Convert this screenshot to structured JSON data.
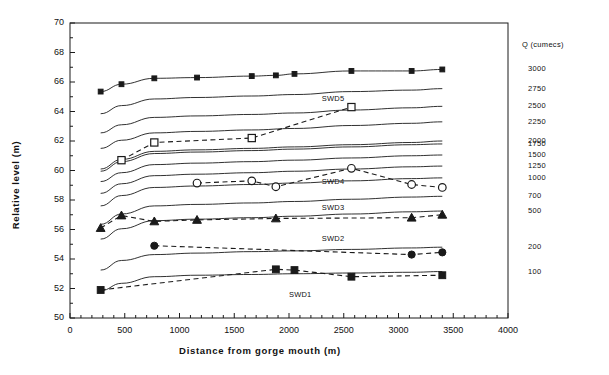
{
  "chart_data": {
    "type": "line",
    "title": "",
    "xlabel": "Distance from gorge mouth  (m)",
    "ylabel": "Relative  level   (m)",
    "xlim": [
      0,
      4000
    ],
    "ylim": [
      50,
      70
    ],
    "xticks": [
      0,
      500,
      1000,
      1500,
      2000,
      2500,
      3000,
      3500,
      4000
    ],
    "yticks": [
      50,
      52,
      54,
      56,
      58,
      60,
      62,
      64,
      66,
      68,
      70
    ],
    "xtick_minor_step": 100,
    "ytick_minor_step": 1,
    "grid": false,
    "legend_position": "right-axis-labels",
    "secondary_axis_title": "Q (cumecs)",
    "secondary_axis_labels": [
      "3000",
      "2750",
      "2500",
      "2250",
      "2000",
      "1750",
      "1500",
      "1250",
      "1000",
      "700",
      "500",
      "200",
      "100"
    ],
    "discharge_series": [
      {
        "name": "Q3000",
        "q": 3000,
        "marker": "filled-square-small",
        "style": "solid",
        "x": [
          280,
          470,
          770,
          1160,
          1660,
          1880,
          2050,
          2570,
          3120,
          3400
        ],
        "y": [
          65.35,
          65.85,
          66.25,
          66.3,
          66.4,
          66.45,
          66.55,
          66.75,
          66.75,
          66.85
        ]
      },
      {
        "name": "Q2750",
        "q": 2750,
        "marker": "none",
        "style": "solid",
        "x": [
          280,
          470,
          770,
          1160,
          1660,
          2050,
          2570,
          3120,
          3400
        ],
        "y": [
          63.85,
          64.4,
          64.85,
          64.95,
          65.05,
          65.15,
          65.35,
          65.45,
          65.55
        ]
      },
      {
        "name": "Q2500",
        "q": 2500,
        "marker": "none",
        "style": "solid",
        "x": [
          280,
          470,
          770,
          1160,
          1660,
          2050,
          2570,
          3120,
          3400
        ],
        "y": [
          62.55,
          63.1,
          63.6,
          63.7,
          63.8,
          63.9,
          64.1,
          64.25,
          64.35
        ]
      },
      {
        "name": "Q2250",
        "q": 2250,
        "marker": "none",
        "style": "solid",
        "x": [
          280,
          470,
          770,
          1160,
          1660,
          2050,
          2570,
          3120,
          3400
        ],
        "y": [
          61.5,
          62.05,
          62.55,
          62.65,
          62.75,
          62.85,
          63.05,
          63.2,
          63.3
        ]
      },
      {
        "name": "Q2000",
        "q": 2000,
        "marker": "none",
        "style": "solid",
        "x": [
          280,
          470,
          770,
          1160,
          1660,
          2050,
          2570,
          3120,
          3400
        ],
        "y": [
          60.1,
          60.75,
          61.3,
          61.4,
          61.5,
          61.6,
          61.75,
          61.9,
          62.0
        ]
      },
      {
        "name": "Q1750",
        "q": 1750,
        "marker": "none",
        "style": "solid",
        "x": [
          280,
          470,
          770,
          1160,
          1660,
          2050,
          2570,
          3120,
          3400
        ],
        "y": [
          59.95,
          60.6,
          61.15,
          61.25,
          61.35,
          61.45,
          61.6,
          61.75,
          61.8
        ]
      },
      {
        "name": "Q1500",
        "q": 1500,
        "marker": "none",
        "style": "solid",
        "x": [
          280,
          470,
          770,
          1160,
          1660,
          2050,
          2570,
          3120,
          3400
        ],
        "y": [
          59.25,
          59.85,
          60.4,
          60.5,
          60.6,
          60.7,
          60.85,
          61.0,
          61.05
        ]
      },
      {
        "name": "Q1250",
        "q": 1250,
        "marker": "none",
        "style": "solid",
        "x": [
          280,
          470,
          770,
          1160,
          1660,
          2050,
          2570,
          3120,
          3400
        ],
        "y": [
          58.45,
          59.1,
          59.65,
          59.75,
          59.85,
          59.95,
          60.1,
          60.25,
          60.3
        ]
      },
      {
        "name": "Q1000",
        "q": 1000,
        "marker": "none",
        "style": "solid",
        "x": [
          280,
          470,
          770,
          1160,
          1660,
          2050,
          2570,
          3120,
          3400
        ],
        "y": [
          57.6,
          58.3,
          58.85,
          58.95,
          59.05,
          59.15,
          59.3,
          59.45,
          59.5
        ]
      },
      {
        "name": "Q700",
        "q": 700,
        "marker": "none",
        "style": "solid",
        "x": [
          280,
          470,
          770,
          1160,
          1660,
          2050,
          2570,
          3120,
          3400
        ],
        "y": [
          56.35,
          57.05,
          57.6,
          57.7,
          57.8,
          57.9,
          58.05,
          58.2,
          58.25
        ]
      },
      {
        "name": "Q500",
        "q": 500,
        "marker": "none",
        "style": "solid",
        "x": [
          280,
          470,
          770,
          1160,
          1660,
          2050,
          2570,
          3120,
          3400
        ],
        "y": [
          55.35,
          56.05,
          56.6,
          56.7,
          56.8,
          56.9,
          57.05,
          57.2,
          57.25
        ]
      },
      {
        "name": "Q200",
        "q": 200,
        "marker": "none",
        "style": "solid",
        "x": [
          280,
          470,
          770,
          1160,
          1660,
          2050,
          2570,
          3120,
          3400
        ],
        "y": [
          53.25,
          53.9,
          54.3,
          54.4,
          54.5,
          54.55,
          54.65,
          54.75,
          54.8
        ]
      },
      {
        "name": "Q100",
        "q": 100,
        "marker": "none",
        "style": "solid",
        "x": [
          280,
          470,
          770,
          1160,
          1660,
          2050,
          2570,
          3120,
          3400
        ],
        "y": [
          51.85,
          52.35,
          52.8,
          52.9,
          52.95,
          53.0,
          53.05,
          53.1,
          53.15
        ]
      }
    ],
    "measured_series": [
      {
        "name": "SWD5",
        "label": "SWD5",
        "marker": "open-square",
        "style": "dashed",
        "x": [
          470,
          770,
          1660,
          2570
        ],
        "y": [
          60.7,
          61.9,
          62.2,
          64.3
        ],
        "label_x": 2300,
        "label_y": 64.85
      },
      {
        "name": "SWD4",
        "label": "SWD4",
        "marker": "open-circle",
        "style": "dashed",
        "x": [
          1160,
          1660,
          1880,
          2570,
          3120,
          3400
        ],
        "y": [
          59.15,
          59.3,
          58.9,
          60.15,
          59.05,
          58.85
        ],
        "label_x": 2300,
        "label_y": 59.25
      },
      {
        "name": "SWD3",
        "label": "SWD3",
        "marker": "filled-triangle",
        "style": "dashed",
        "x": [
          280,
          470,
          770,
          1160,
          1880,
          3120,
          3400
        ],
        "y": [
          56.1,
          56.95,
          56.55,
          56.65,
          56.75,
          56.8,
          57.0
        ],
        "label_x": 2300,
        "label_y": 57.45
      },
      {
        "name": "SWD2",
        "label": "SWD2",
        "marker": "filled-circle",
        "style": "dashed",
        "x": [
          770,
          3120,
          3400
        ],
        "y": [
          54.9,
          54.3,
          54.45
        ],
        "label_x": 2300,
        "label_y": 55.35
      },
      {
        "name": "SWD1",
        "label": "SWD1",
        "marker": "filled-square",
        "style": "dashed",
        "x": [
          280,
          1880,
          2050,
          2570,
          3400
        ],
        "y": [
          51.9,
          53.3,
          53.25,
          52.8,
          52.9
        ],
        "label_x": 2000,
        "label_y": 51.55
      }
    ],
    "colors": {
      "line": "#1a1a1a",
      "text": "#111111",
      "background": "#ffffff"
    }
  }
}
